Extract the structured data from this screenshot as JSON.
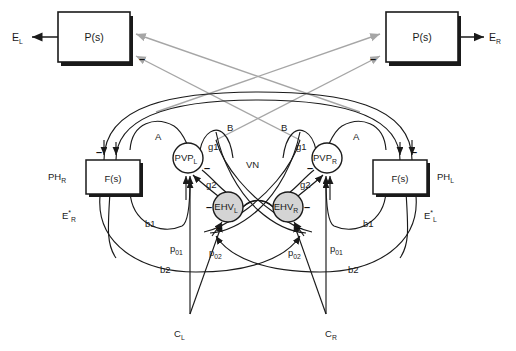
{
  "figure": {
    "type": "block-diagram",
    "background_color": "#ffffff",
    "stroke_color": "#1a1a1a",
    "gray_stroke_color": "#a6a6a6",
    "node_fill_gray": "#d4d4d4"
  },
  "blocks": {
    "plant_left": {
      "label": "P(s)",
      "name": "plant-left"
    },
    "plant_right": {
      "label": "P(s)",
      "name": "plant-right"
    },
    "filter_left": {
      "label": "F(s)",
      "name": "filter-left"
    },
    "filter_right": {
      "label": "F(s)",
      "name": "filter-right"
    }
  },
  "nodes": {
    "pvp_left": {
      "base": "PVP",
      "sub": "L"
    },
    "pvp_right": {
      "base": "PVP",
      "sub": "R"
    },
    "ehv_left": {
      "base": "EHV",
      "sub": "L"
    },
    "ehv_right": {
      "base": "EHV",
      "sub": "R"
    }
  },
  "signals": {
    "e_left": {
      "base": "E",
      "sub": "L"
    },
    "e_right": {
      "base": "E",
      "sub": "R"
    },
    "ph_right": {
      "base": "PH",
      "sub": "R"
    },
    "ph_left": {
      "base": "PH",
      "sub": "L"
    },
    "e_star_right": {
      "base": "E",
      "star": "*",
      "sub": "R"
    },
    "e_star_left": {
      "base": "E",
      "star": "*",
      "sub": "L"
    },
    "c_left": {
      "base": "C",
      "sub": "L"
    },
    "c_right": {
      "base": "C",
      "sub": "R"
    }
  },
  "gains": {
    "a_left": "A",
    "a_right": "A",
    "b_left": "B",
    "b_right": "B",
    "g1_left": "g1",
    "g1_right": "g1",
    "g2_left": "g2",
    "g2_right": "g2",
    "b1_left": "b1",
    "b1_right": "b1",
    "b2_left": "b2",
    "b2_right": "b2",
    "p01_left": {
      "base": "p",
      "sub": "01"
    },
    "p01_right": {
      "base": "p",
      "sub": "01"
    },
    "p02_left": {
      "base": "p",
      "sub": "02"
    },
    "p02_right": {
      "base": "p",
      "sub": "02"
    },
    "vn": "VN"
  },
  "signs": {
    "minus": "–"
  }
}
